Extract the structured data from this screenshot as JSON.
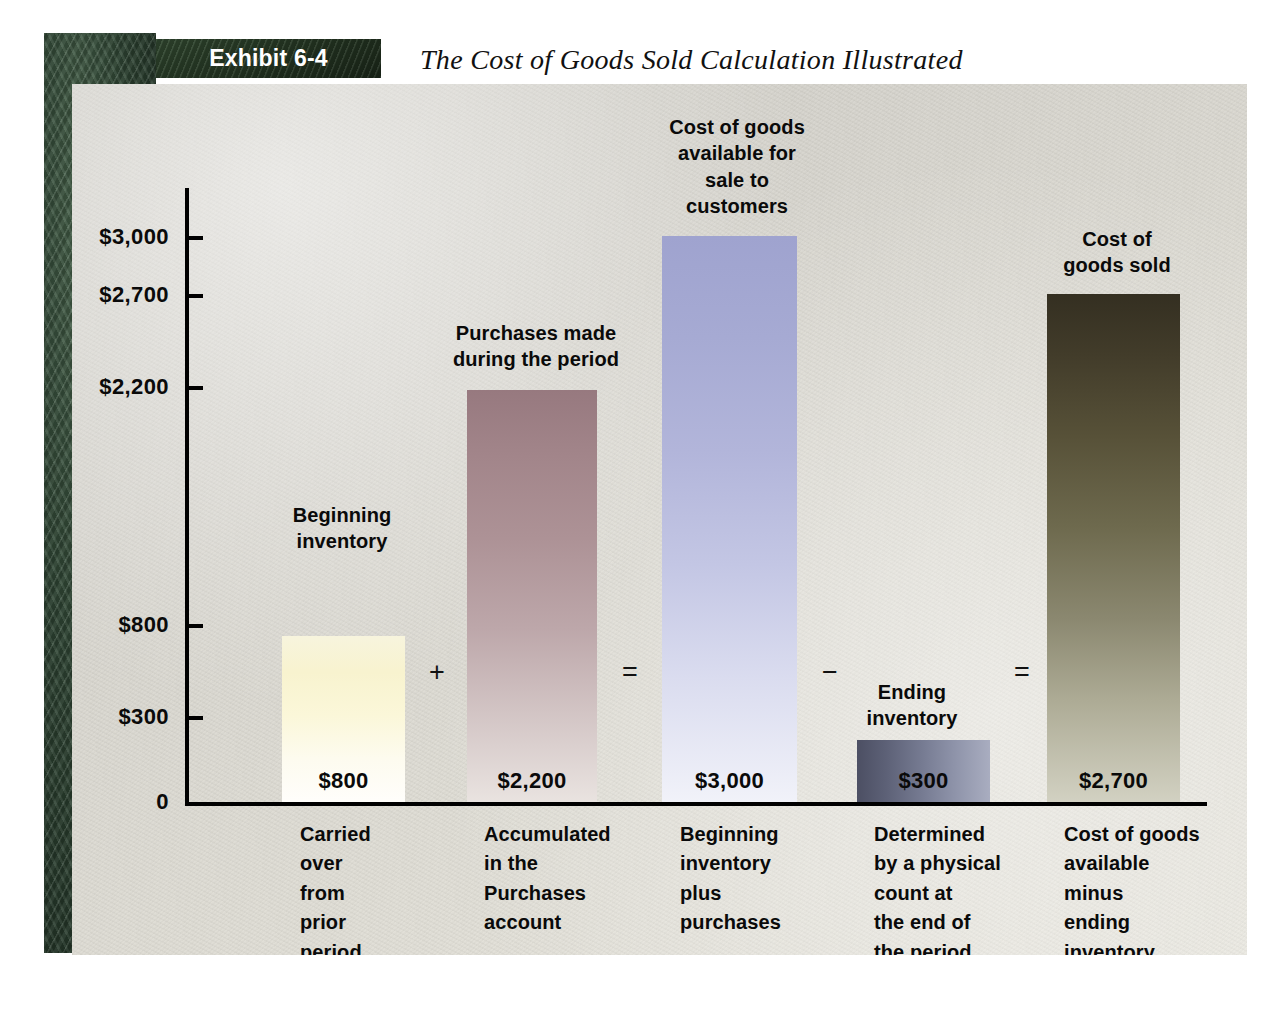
{
  "exhibit": {
    "chip_label": "Exhibit 6-4",
    "title": "The Cost of Goods Sold Calculation Illustrated"
  },
  "axis": {
    "y_ticks": [
      "$3,000",
      "$2,700",
      "$2,200",
      "$800",
      "$300",
      "0"
    ]
  },
  "operators": {
    "op1": "+",
    "op2": "=",
    "op3": "−",
    "op4": "="
  },
  "bars": [
    {
      "top_label": "Beginning\ninventory",
      "value_label": "$800",
      "bottom_desc": "Carried\nover\nfrom\nprior\nperiod",
      "color": "#f8f3cf"
    },
    {
      "top_label": "Purchases made\nduring the period",
      "value_label": "$2,200",
      "bottom_desc": "Accumulated\nin the\nPurchases\naccount",
      "color": "#a2858a"
    },
    {
      "top_label": "Cost of goods\navailable for\nsale to\ncustomers",
      "value_label": "$3,000",
      "bottom_desc": "Beginning\ninventory\nplus\npurchases",
      "color": "#a6aad3"
    },
    {
      "top_label": "Ending\ninventory",
      "value_label": "$300",
      "bottom_desc": "Determined\nby a physical\ncount at\nthe end of\nthe period",
      "color": "#5d6177"
    },
    {
      "top_label": "Cost of\ngoods sold",
      "value_label": "$2,700",
      "bottom_desc": "Cost of goods\navailable\nminus\nending\ninventory",
      "color": "#423c2a"
    }
  ],
  "chart_data": {
    "type": "bar",
    "title": "The Cost of Goods Sold Calculation Illustrated",
    "subtitle": "Exhibit 6-4",
    "xlabel": "",
    "ylabel": "",
    "categories": [
      "Beginning inventory",
      "Purchases made during the period",
      "Cost of goods available for sale to customers",
      "Ending inventory",
      "Cost of goods sold"
    ],
    "values": [
      800,
      2200,
      3000,
      300,
      2700
    ],
    "value_labels": [
      "$800",
      "$2,200",
      "$3,000",
      "$300",
      "$2,700"
    ],
    "ylim": [
      0,
      3000
    ],
    "ytick_values": [
      0,
      300,
      800,
      2200,
      2700,
      3000
    ],
    "ytick_labels": [
      "0",
      "$300",
      "$800",
      "$2,200",
      "$2,700",
      "$3,000"
    ],
    "grid": false,
    "legend": "none",
    "annotations": [
      "+",
      "=",
      "−",
      "="
    ],
    "bar_colors": [
      "#f8f3cf",
      "#a2858a",
      "#a6aad3",
      "#5d6177",
      "#423c2a"
    ],
    "notes": [
      "Carried over from prior period",
      "Accumulated in the Purchases account",
      "Beginning inventory plus purchases",
      "Determined by a physical count at the end of the period",
      "Cost of goods available minus ending inventory"
    ]
  }
}
